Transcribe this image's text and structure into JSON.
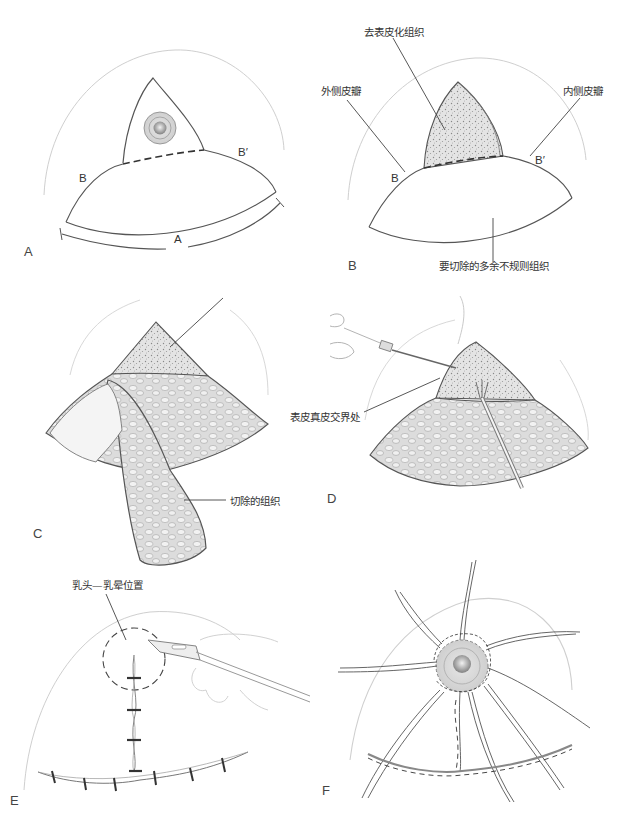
{
  "figure": {
    "panels": [
      {
        "id": "A",
        "letter": "A",
        "point_labels": {
          "b": "B",
          "b_prime": "B′",
          "arc_a": "A"
        },
        "callouts": []
      },
      {
        "id": "B",
        "letter": "B",
        "point_labels": {
          "b": "B",
          "b_prime": "B′"
        },
        "callouts": [
          {
            "key": "deepithelialized",
            "text": "去表皮化组织"
          },
          {
            "key": "lateral_flap",
            "text": "外侧皮瓣"
          },
          {
            "key": "medial_flap",
            "text": "内侧皮瓣"
          },
          {
            "key": "excess_tissue",
            "text": "要切除的多余不规则组织"
          }
        ]
      },
      {
        "id": "C",
        "letter": "C",
        "callouts": [
          {
            "key": "excised_tissue",
            "text": "切除的组织"
          }
        ]
      },
      {
        "id": "D",
        "letter": "D",
        "callouts": [
          {
            "key": "dermal_junction",
            "text": "表皮真皮交界处"
          }
        ]
      },
      {
        "id": "E",
        "letter": "E",
        "callouts": [
          {
            "key": "nipple_areola_position",
            "text": "乳头—乳晕位置"
          }
        ]
      },
      {
        "id": "F",
        "letter": "F",
        "callouts": []
      }
    ],
    "colors": {
      "line": "#5a5a5a",
      "faint_line": "#c8c8c8",
      "shading": "#d9d9d9",
      "background": "#ffffff"
    }
  }
}
